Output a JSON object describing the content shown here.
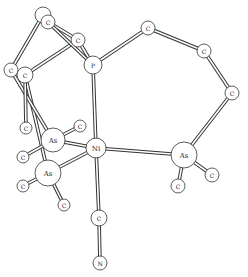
{
  "colors": {
    "line": "#333333",
    "fill": "#ffffff",
    "text": "#222222"
  },
  "atoms": [
    {
      "id": "c_top_back",
      "label": "",
      "x": 43,
      "y": 15,
      "r": 8
    },
    {
      "id": "c_top",
      "label": "C",
      "x": 48,
      "y": 22,
      "r": 7
    },
    {
      "id": "c_upper",
      "label": "C",
      "x": 78,
      "y": 40,
      "r": 7
    },
    {
      "id": "p",
      "label": "P",
      "x": 93,
      "y": 65,
      "r": 9
    },
    {
      "id": "c_left1",
      "label": "C",
      "x": 11,
      "y": 70,
      "r": 7
    },
    {
      "id": "c_left2",
      "label": "C",
      "x": 25,
      "y": 75,
      "r": 8
    },
    {
      "id": "c_ring1",
      "label": "C",
      "x": 148,
      "y": 28,
      "r": 7
    },
    {
      "id": "c_ring2",
      "label": "C",
      "x": 204,
      "y": 51,
      "r": 7
    },
    {
      "id": "c_ring3",
      "label": "C",
      "x": 232,
      "y": 93,
      "r": 7
    },
    {
      "id": "c_as1_top",
      "label": "C",
      "x": 26,
      "y": 128,
      "r": 6
    },
    {
      "id": "c_as1_right",
      "label": "C",
      "x": 80,
      "y": 126,
      "r": 6
    },
    {
      "id": "as1",
      "label": "As",
      "x": 53,
      "y": 140,
      "r": 12
    },
    {
      "id": "ni",
      "label": "Ni",
      "x": 96,
      "y": 148,
      "r": 10
    },
    {
      "id": "c_as1_left",
      "label": "C",
      "x": 23,
      "y": 157,
      "r": 6
    },
    {
      "id": "as2",
      "label": "As",
      "x": 48,
      "y": 173,
      "r": 13
    },
    {
      "id": "c_as2_left",
      "label": "C",
      "x": 23,
      "y": 186,
      "r": 6
    },
    {
      "id": "c_as2_bottom",
      "label": "C",
      "x": 64,
      "y": 205,
      "r": 6
    },
    {
      "id": "as3",
      "label": "As",
      "x": 184,
      "y": 155,
      "r": 13
    },
    {
      "id": "c_as3_right",
      "label": "C",
      "x": 212,
      "y": 175,
      "r": 7
    },
    {
      "id": "c_as3_bottom",
      "label": "C",
      "x": 178,
      "y": 186,
      "r": 7
    },
    {
      "id": "c_cn",
      "label": "C",
      "x": 99,
      "y": 218,
      "r": 8
    },
    {
      "id": "n",
      "label": "N",
      "x": 100,
      "y": 263,
      "r": 7
    }
  ],
  "bonds": [
    [
      "c_top_back",
      "c_left1"
    ],
    [
      "c_top",
      "c_upper"
    ],
    [
      "c_upper",
      "c_left2"
    ],
    [
      "c_upper",
      "p"
    ],
    [
      "c_top",
      "p"
    ],
    [
      "p",
      "c_ring1"
    ],
    [
      "c_ring1",
      "c_ring2"
    ],
    [
      "c_ring2",
      "c_ring3"
    ],
    [
      "c_ring3",
      "as3"
    ],
    [
      "c_left1",
      "c_left2"
    ],
    [
      "c_left2",
      "as2"
    ],
    [
      "c_left1",
      "as1"
    ],
    [
      "c_left2",
      "c_as1_top"
    ],
    [
      "p",
      "ni"
    ],
    [
      "as1",
      "ni"
    ],
    [
      "as2",
      "ni"
    ],
    [
      "as3",
      "ni"
    ],
    [
      "as1",
      "c_as1_right"
    ],
    [
      "as1",
      "c_as1_left"
    ],
    [
      "as2",
      "c_as2_left"
    ],
    [
      "as2",
      "c_as2_bottom"
    ],
    [
      "as3",
      "c_as3_right"
    ],
    [
      "as3",
      "c_as3_bottom"
    ],
    [
      "ni",
      "c_cn"
    ],
    [
      "c_cn",
      "n"
    ]
  ]
}
